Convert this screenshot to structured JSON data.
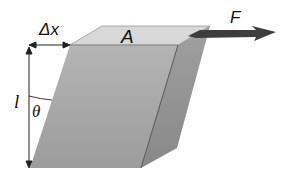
{
  "figure": {
    "labels": {
      "displacement": "Δx",
      "area": "A",
      "force": "F",
      "length": "l",
      "angle": "θ"
    },
    "colors": {
      "top_face": "#d6d6d6",
      "front_face": "#a9a9a9",
      "side_face": "#8f8f8f",
      "force_arrow": "#3a3a3a",
      "dimension_lines": "#222222",
      "background": "#ffffff"
    }
  }
}
